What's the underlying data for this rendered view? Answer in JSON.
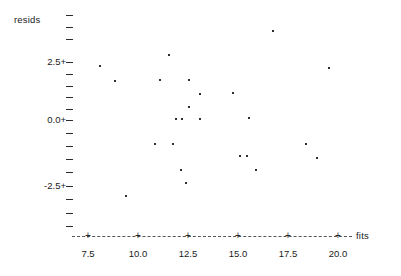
{
  "chart_data": {
    "type": "scatter",
    "title": "",
    "xlabel": "fits",
    "ylabel": "resids",
    "xlim": [
      6.6,
      21.0
    ],
    "ylim": [
      -4.0,
      4.4
    ],
    "grid": false,
    "legend": null,
    "x_ticks": [
      {
        "value": 7.5,
        "label": "7.5",
        "px": 88
      },
      {
        "value": 10.0,
        "label": "10.0",
        "px": 138
      },
      {
        "value": 12.5,
        "label": "12.5",
        "px": 188
      },
      {
        "value": 15.0,
        "label": "15.0",
        "px": 238
      },
      {
        "value": 17.5,
        "label": "17.5",
        "px": 288
      },
      {
        "value": 20.0,
        "label": "20.0",
        "px": 338
      }
    ],
    "y_ticks": [
      {
        "value": 3.75,
        "label": "",
        "px": 15
      },
      {
        "value": 3.25,
        "label": "",
        "px": 27
      },
      {
        "value": 2.95,
        "label": "",
        "px": 39
      },
      {
        "value": 2.5,
        "label": "2.5+",
        "px": 62
      },
      {
        "value": 2.0,
        "label": "",
        "px": 74
      },
      {
        "value": 1.5,
        "label": "",
        "px": 86
      },
      {
        "value": 1.0,
        "label": "",
        "px": 97
      },
      {
        "value": 0.5,
        "label": "",
        "px": 109
      },
      {
        "value": 0.0,
        "label": "0.0+",
        "px": 120
      },
      {
        "value": -0.5,
        "label": "",
        "px": 133
      },
      {
        "value": -1.0,
        "label": "",
        "px": 146
      },
      {
        "value": -1.5,
        "label": "",
        "px": 159
      },
      {
        "value": -2.0,
        "label": "",
        "px": 172
      },
      {
        "value": -2.5,
        "label": "-2.5+",
        "px": 186
      },
      {
        "value": -3.0,
        "label": "",
        "px": 199
      },
      {
        "value": -3.5,
        "label": "",
        "px": 213
      },
      {
        "value": -3.9,
        "label": "",
        "px": 226
      }
    ],
    "points": [
      {
        "x": 8.1,
        "y": 2.3,
        "px": 100,
        "py": 66
      },
      {
        "x": 8.9,
        "y": 1.7,
        "px": 115,
        "py": 81
      },
      {
        "x": 11.6,
        "y": 2.8,
        "px": 169,
        "py": 55
      },
      {
        "x": 11.1,
        "y": 1.7,
        "px": 160,
        "py": 80
      },
      {
        "x": 12.6,
        "y": 1.7,
        "px": 189,
        "py": 80
      },
      {
        "x": 13.1,
        "y": 1.1,
        "px": 200,
        "py": 94
      },
      {
        "x": 12.6,
        "y": 0.6,
        "px": 189,
        "py": 107
      },
      {
        "x": 11.9,
        "y": 0.0,
        "px": 176,
        "py": 119
      },
      {
        "x": 12.2,
        "y": 0.0,
        "px": 182,
        "py": 119
      },
      {
        "x": 13.1,
        "y": 0.0,
        "px": 200,
        "py": 119
      },
      {
        "x": 16.7,
        "y": 3.8,
        "px": 273,
        "py": 31
      },
      {
        "x": 19.5,
        "y": 2.2,
        "px": 329,
        "py": 68
      },
      {
        "x": 14.8,
        "y": 1.2,
        "px": 233,
        "py": 93
      },
      {
        "x": 15.6,
        "y": 0.1,
        "px": 249,
        "py": 118
      },
      {
        "x": 10.8,
        "y": -1.0,
        "px": 155,
        "py": 144
      },
      {
        "x": 11.7,
        "y": -1.0,
        "px": 173,
        "py": 144
      },
      {
        "x": 18.4,
        "y": -1.0,
        "px": 306,
        "py": 144
      },
      {
        "x": 15.1,
        "y": -1.5,
        "px": 240,
        "py": 156
      },
      {
        "x": 15.5,
        "y": -1.5,
        "px": 247,
        "py": 156
      },
      {
        "x": 18.9,
        "y": -1.6,
        "px": 317,
        "py": 158
      },
      {
        "x": 12.2,
        "y": -2.1,
        "px": 181,
        "py": 170
      },
      {
        "x": 15.9,
        "y": -2.1,
        "px": 256,
        "py": 170
      },
      {
        "x": 12.4,
        "y": -2.7,
        "px": 186,
        "py": 183
      },
      {
        "x": 9.4,
        "y": -3.2,
        "px": 126,
        "py": 196
      }
    ]
  },
  "axes": {
    "y_title": "resids",
    "x_title": "fits",
    "x_axis_start_px": 72,
    "x_axis_end_px": 352,
    "x_axis_y_px": 236,
    "x_label_y_px": 249
  }
}
